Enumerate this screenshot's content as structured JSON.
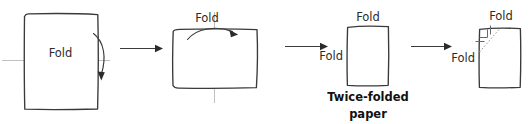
{
  "figure": {
    "type": "instructional-diagram",
    "steps": 4,
    "colors": {
      "paper_outline": "#3a3a3a",
      "fold_guide": "#b9b9b9",
      "arrow": "#2b2b2b",
      "text": "#2b2b2b",
      "caption": "#111111",
      "dotted_guide": "#9a9a9a",
      "background": "#ffffff"
    }
  },
  "steps": [
    {
      "id": "step-1",
      "shape": "portrait-rectangle",
      "labels": [
        {
          "key": "fold_center",
          "text": "Fold"
        }
      ],
      "fold_guide": "horizontal-center",
      "motion": "curved-arrow-down-right"
    },
    {
      "id": "step-2",
      "shape": "landscape-rectangle",
      "labels": [
        {
          "key": "fold_top",
          "text": "Fold"
        }
      ],
      "fold_guide": "vertical-center",
      "motion": "curved-arrow-over-top-rightward"
    },
    {
      "id": "step-3",
      "shape": "portrait-rectangle",
      "labels": [
        {
          "key": "fold_top",
          "text": "Fold"
        },
        {
          "key": "fold_left",
          "text": "Fold"
        }
      ],
      "caption_lines": [
        "Twice-folded",
        "paper"
      ]
    },
    {
      "id": "step-4",
      "shape": "portrait-rectangle",
      "labels": [
        {
          "key": "fold_top",
          "text": "Fold"
        },
        {
          "key": "fold_left",
          "text": "Fold"
        }
      ],
      "corner_marks": {
        "diagonal": "dotted",
        "right_angle_square": true,
        "edge_ticks": 2
      }
    }
  ],
  "flow_arrows": [
    {
      "id": "arrow-1",
      "from": "step-1",
      "to": "step-2",
      "direction": "right"
    },
    {
      "id": "arrow-2",
      "from": "step-2",
      "to": "step-3",
      "direction": "right"
    },
    {
      "id": "arrow-3",
      "from": "step-3",
      "to": "step-4",
      "direction": "right"
    }
  ],
  "text": {
    "fold": "Fold",
    "caption_line1": "Twice-folded",
    "caption_line2": "paper"
  }
}
